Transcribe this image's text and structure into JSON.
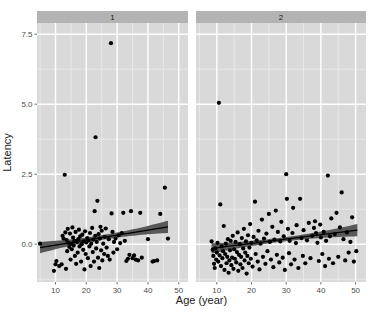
{
  "chart_data": {
    "type": "scatter",
    "title": "",
    "xlabel": "Age (year)",
    "ylabel": "Latency",
    "xlim": [
      4,
      53
    ],
    "ylim": [
      -1.35,
      7.9
    ],
    "xticks": [
      10,
      20,
      30,
      40,
      50
    ],
    "yticks": [
      0.0,
      2.5,
      5.0,
      7.5
    ],
    "xtick_labels": [
      "10",
      "20",
      "30",
      "40",
      "50"
    ],
    "ytick_labels": [
      "0.0",
      "2.5",
      "5.0",
      "7.5"
    ],
    "grid": true,
    "legend": "none",
    "facet": {
      "type": "column",
      "labels": [
        "1",
        "2"
      ]
    },
    "colors": {
      "panel_background": "#d9d9d9",
      "strip_background": "#b3b3b3",
      "grid_major": "#ffffff",
      "grid_minor": "#ececec",
      "point": "#000000",
      "fit_line": "#000000",
      "ribbon": "#4d4d4d",
      "text": "#1a1a1a",
      "page_background": "#ffffff"
    },
    "panels": [
      {
        "label": "1",
        "n_points": 104,
        "fit": {
          "type": "linear",
          "x_start": 5.0,
          "x_end": 46.5,
          "y_start": -0.12,
          "y_end": 0.62,
          "band_half_start": 0.2,
          "band_half_end": 0.22,
          "band_half_mid": 0.085
        },
        "points": [
          [
            5.0,
            0.02
          ],
          [
            9.5,
            -0.95
          ],
          [
            10.0,
            -0.72
          ],
          [
            10.3,
            -0.6
          ],
          [
            11.2,
            -0.78
          ],
          [
            12.0,
            -0.72
          ],
          [
            12.3,
            0.3
          ],
          [
            12.6,
            0.2
          ],
          [
            13.0,
            2.48
          ],
          [
            13.2,
            0.42
          ],
          [
            13.4,
            -0.88
          ],
          [
            13.6,
            0.15
          ],
          [
            13.8,
            -0.25
          ],
          [
            14.0,
            0.55
          ],
          [
            14.2,
            0.05
          ],
          [
            14.5,
            -0.1
          ],
          [
            14.7,
            0.38
          ],
          [
            14.9,
            -0.55
          ],
          [
            15.1,
            0.02
          ],
          [
            15.3,
            -0.18
          ],
          [
            15.5,
            0.6
          ],
          [
            15.7,
            0.24
          ],
          [
            15.9,
            -0.05
          ],
          [
            16.1,
            0.12
          ],
          [
            16.3,
            -0.42
          ],
          [
            16.5,
            0.44
          ],
          [
            16.7,
            -0.7
          ],
          [
            17.0,
            0.08
          ],
          [
            17.2,
            -0.3
          ],
          [
            17.4,
            0.18
          ],
          [
            17.6,
            0.52
          ],
          [
            17.8,
            -0.08
          ],
          [
            18.0,
            0.28
          ],
          [
            18.3,
            -0.62
          ],
          [
            18.5,
            0.0
          ],
          [
            18.7,
            0.34
          ],
          [
            19.0,
            -0.2
          ],
          [
            19.2,
            0.1
          ],
          [
            19.4,
            -0.9
          ],
          [
            19.6,
            0.46
          ],
          [
            19.8,
            -0.35
          ],
          [
            20.0,
            0.06
          ],
          [
            20.3,
            0.22
          ],
          [
            20.5,
            -0.5
          ],
          [
            20.7,
            0.14
          ],
          [
            21.0,
            -0.08
          ],
          [
            21.2,
            0.4
          ],
          [
            21.4,
            -0.78
          ],
          [
            21.6,
            0.02
          ],
          [
            21.9,
            0.58
          ],
          [
            22.1,
            -0.28
          ],
          [
            22.3,
            0.16
          ],
          [
            22.5,
            -0.62
          ],
          [
            22.7,
            1.18
          ],
          [
            22.9,
            0.3
          ],
          [
            23.0,
            3.82
          ],
          [
            23.2,
            -0.15
          ],
          [
            23.4,
            0.08
          ],
          [
            23.6,
            1.55
          ],
          [
            23.8,
            -0.48
          ],
          [
            24.0,
            0.36
          ],
          [
            24.2,
            -0.85
          ],
          [
            24.4,
            0.2
          ],
          [
            24.6,
            0.62
          ],
          [
            24.8,
            -0.22
          ],
          [
            25.0,
            0.48
          ],
          [
            25.2,
            -0.58
          ],
          [
            25.5,
            0.02
          ],
          [
            25.8,
            -0.35
          ],
          [
            26.0,
            0.26
          ],
          [
            26.3,
            0.56
          ],
          [
            26.6,
            -0.12
          ],
          [
            27.0,
            -0.42
          ],
          [
            27.3,
            0.18
          ],
          [
            27.6,
            -0.55
          ],
          [
            28.0,
            7.18
          ],
          [
            28.2,
            1.1
          ],
          [
            28.5,
            0.44
          ],
          [
            28.8,
            -0.3
          ],
          [
            29.0,
            0.08
          ],
          [
            29.5,
            0.2
          ],
          [
            30.0,
            -0.18
          ],
          [
            30.5,
            0.32
          ],
          [
            31.0,
            0.04
          ],
          [
            31.5,
            0.4
          ],
          [
            32.0,
            1.12
          ],
          [
            32.5,
            0.12
          ],
          [
            33.0,
            -0.6
          ],
          [
            33.5,
            -0.52
          ],
          [
            34.0,
            -0.38
          ],
          [
            34.5,
            1.18
          ],
          [
            35.0,
            -0.5
          ],
          [
            35.5,
            -0.4
          ],
          [
            36.0,
            -0.55
          ],
          [
            36.8,
            -0.58
          ],
          [
            37.5,
            1.12
          ],
          [
            38.0,
            -0.48
          ],
          [
            40.0,
            0.18
          ],
          [
            41.5,
            -0.62
          ],
          [
            42.0,
            -0.6
          ],
          [
            43.0,
            -0.58
          ],
          [
            44.0,
            1.08
          ],
          [
            45.5,
            2.02
          ],
          [
            46.5,
            0.2
          ]
        ]
      },
      {
        "label": "2",
        "n_points": 138,
        "fit": {
          "type": "linear",
          "x_start": 8.5,
          "x_end": 50.5,
          "y_start": -0.15,
          "y_end": 0.5,
          "band_half_start": 0.18,
          "band_half_end": 0.22,
          "band_half_mid": 0.075
        },
        "points": [
          [
            8.5,
            0.1
          ],
          [
            8.8,
            -0.2
          ],
          [
            9.0,
            -0.42
          ],
          [
            9.2,
            -0.7
          ],
          [
            9.4,
            -0.85
          ],
          [
            9.6,
            -0.15
          ],
          [
            9.8,
            -0.55
          ],
          [
            10.0,
            -0.3
          ],
          [
            10.2,
            0.05
          ],
          [
            10.4,
            -0.62
          ],
          [
            10.6,
            5.05
          ],
          [
            10.8,
            -0.4
          ],
          [
            11.0,
            1.42
          ],
          [
            11.2,
            -0.78
          ],
          [
            11.4,
            -0.08
          ],
          [
            11.6,
            -0.5
          ],
          [
            11.8,
            -0.25
          ],
          [
            12.0,
            0.65
          ],
          [
            12.2,
            -0.92
          ],
          [
            12.4,
            -0.35
          ],
          [
            12.6,
            0.02
          ],
          [
            12.8,
            -0.68
          ],
          [
            13.0,
            -0.45
          ],
          [
            13.2,
            0.18
          ],
          [
            13.4,
            -1.02
          ],
          [
            13.6,
            -0.58
          ],
          [
            13.8,
            -0.22
          ],
          [
            14.0,
            0.12
          ],
          [
            14.2,
            -0.75
          ],
          [
            14.4,
            -0.48
          ],
          [
            14.6,
            0.3
          ],
          [
            14.8,
            -0.88
          ],
          [
            15.0,
            -0.18
          ],
          [
            15.2,
            -0.52
          ],
          [
            15.4,
            0.08
          ],
          [
            15.6,
            -0.65
          ],
          [
            15.8,
            -0.28
          ],
          [
            16.0,
            0.42
          ],
          [
            16.2,
            -0.95
          ],
          [
            16.4,
            -0.38
          ],
          [
            16.6,
            0.0
          ],
          [
            16.8,
            -0.72
          ],
          [
            17.0,
            -0.45
          ],
          [
            17.2,
            0.22
          ],
          [
            17.4,
            -0.85
          ],
          [
            17.6,
            -0.15
          ],
          [
            17.8,
            0.55
          ],
          [
            18.0,
            -0.58
          ],
          [
            18.2,
            -0.3
          ],
          [
            18.4,
            0.1
          ],
          [
            18.6,
            -1.05
          ],
          [
            18.8,
            -0.42
          ],
          [
            19.0,
            0.32
          ],
          [
            19.2,
            -0.68
          ],
          [
            19.4,
            -0.12
          ],
          [
            19.6,
            0.72
          ],
          [
            19.8,
            -0.52
          ],
          [
            20.0,
            0.05
          ],
          [
            20.3,
            -0.8
          ],
          [
            20.6,
            0.26
          ],
          [
            21.0,
            1.52
          ],
          [
            21.2,
            -0.35
          ],
          [
            21.5,
            0.14
          ],
          [
            21.8,
            -0.62
          ],
          [
            22.0,
            0.48
          ],
          [
            22.3,
            -0.9
          ],
          [
            22.6,
            0.02
          ],
          [
            23.0,
            0.88
          ],
          [
            23.3,
            -0.45
          ],
          [
            23.6,
            0.2
          ],
          [
            24.0,
            -0.7
          ],
          [
            24.3,
            0.38
          ],
          [
            24.6,
            -0.25
          ],
          [
            25.0,
            1.08
          ],
          [
            25.3,
            0.08
          ],
          [
            25.6,
            -0.55
          ],
          [
            26.0,
            0.62
          ],
          [
            26.3,
            -0.82
          ],
          [
            26.6,
            0.16
          ],
          [
            27.0,
            1.2
          ],
          [
            27.3,
            -0.38
          ],
          [
            27.6,
            0.44
          ],
          [
            28.0,
            -0.65
          ],
          [
            28.3,
            0.1
          ],
          [
            28.6,
            0.8
          ],
          [
            29.0,
            -0.48
          ],
          [
            29.3,
            0.28
          ],
          [
            29.6,
            -0.92
          ],
          [
            30.0,
            2.5
          ],
          [
            30.2,
            1.62
          ],
          [
            30.5,
            0.55
          ],
          [
            30.8,
            -0.32
          ],
          [
            31.0,
            0.12
          ],
          [
            31.4,
            -0.72
          ],
          [
            31.8,
            0.4
          ],
          [
            32.0,
            1.3
          ],
          [
            32.4,
            -0.55
          ],
          [
            32.8,
            0.04
          ],
          [
            33.0,
            0.68
          ],
          [
            33.5,
            -0.85
          ],
          [
            34.0,
            1.62
          ],
          [
            34.4,
            0.22
          ],
          [
            34.8,
            -0.42
          ],
          [
            35.0,
            0.5
          ],
          [
            35.5,
            -0.68
          ],
          [
            36.0,
            0.14
          ],
          [
            36.5,
            0.76
          ],
          [
            37.0,
            -0.5
          ],
          [
            37.5,
            0.3
          ],
          [
            38.0,
            0.58
          ],
          [
            38.3,
            0.82
          ],
          [
            38.6,
            0.4
          ],
          [
            39.0,
            0.05
          ],
          [
            39.4,
            -0.6
          ],
          [
            39.8,
            0.7
          ],
          [
            40.0,
            0.24
          ],
          [
            40.4,
            -0.35
          ],
          [
            40.8,
            0.44
          ],
          [
            41.2,
            -0.78
          ],
          [
            41.5,
            0.12
          ],
          [
            42.0,
            2.45
          ],
          [
            42.3,
            -0.52
          ],
          [
            42.6,
            0.28
          ],
          [
            43.0,
            0.92
          ],
          [
            43.5,
            -0.68
          ],
          [
            44.0,
            0.36
          ],
          [
            44.5,
            1.12
          ],
          [
            45.0,
            -0.45
          ],
          [
            45.5,
            0.6
          ],
          [
            46.0,
            1.85
          ],
          [
            46.5,
            0.18
          ],
          [
            47.0,
            -0.58
          ],
          [
            47.5,
            0.42
          ],
          [
            48.0,
            -0.3
          ],
          [
            48.5,
            0.08
          ],
          [
            49.0,
            0.96
          ],
          [
            49.5,
            -0.62
          ],
          [
            50.2,
            -0.25
          ]
        ]
      }
    ]
  }
}
